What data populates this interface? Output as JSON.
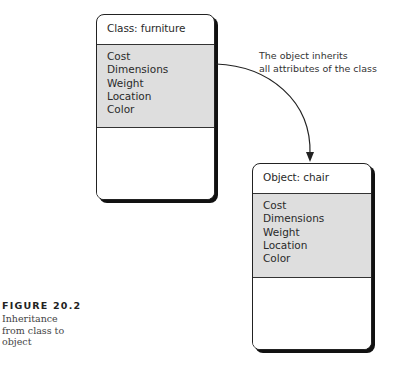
{
  "diagram": {
    "class_box": {
      "title": "Class: furniture",
      "attributes": [
        "Cost",
        "Dimensions",
        "Weight",
        "Location",
        "Color"
      ]
    },
    "object_box": {
      "title": "Object: chair",
      "attributes": [
        "Cost",
        "Dimensions",
        "Weight",
        "Location",
        "Color"
      ]
    },
    "annotation": {
      "line1": "The object inherits",
      "line2": "all attributes of the class"
    },
    "arrow": {
      "from": "class_box",
      "to": "object_box",
      "stroke_color": "#222222"
    }
  },
  "caption": {
    "figure_number": "FIGURE 20.2",
    "lines": [
      "Inheritance",
      "from class to",
      "object"
    ]
  },
  "colors": {
    "attribute_fill": "#dedede",
    "border": "#222222",
    "shadow": "#111111"
  }
}
